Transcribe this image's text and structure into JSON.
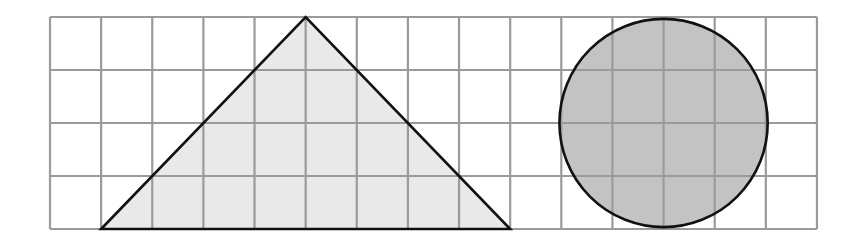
{
  "diagram": {
    "type": "grid-shapes",
    "canvas": {
      "width": 857,
      "height": 239,
      "background": "#ffffff"
    },
    "grid": {
      "columns": 15,
      "rows": 4,
      "origin_x": 50,
      "origin_y": 17,
      "cell_width": 51.13,
      "cell_height": 53,
      "line_color": "#9a9a9a",
      "line_width": 2.2
    },
    "shapes": [
      {
        "id": "triangle",
        "kind": "triangle",
        "grid_vertices": [
          [
            1,
            4
          ],
          [
            5,
            0
          ],
          [
            9,
            4
          ]
        ],
        "base_cells": 8,
        "height_cells": 4,
        "fill": "#e9e9e9",
        "stroke": "#111111",
        "stroke_width": 2.6
      },
      {
        "id": "circle",
        "kind": "circle",
        "grid_center": [
          12,
          2
        ],
        "radius_cells": 2,
        "diameter_cells": 4,
        "fill": "#c3c3c3",
        "stroke": "#111111",
        "stroke_width": 2.6
      }
    ]
  }
}
